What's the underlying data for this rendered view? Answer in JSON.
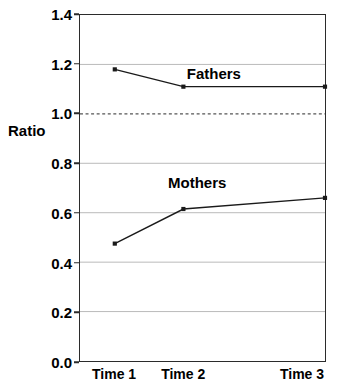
{
  "chart_data": {
    "type": "line",
    "title": "",
    "xlabel": "",
    "ylabel": "Ratio",
    "categories": [
      "Time 1",
      "Time 2",
      "Time 3"
    ],
    "ylim": [
      0.0,
      1.4
    ],
    "yticks": [
      "0.0",
      "0.2",
      "0.4",
      "0.6",
      "0.8",
      "1.0",
      "1.2",
      "1.4"
    ],
    "ytick_values": [
      0.0,
      0.2,
      0.4,
      0.6,
      0.8,
      1.0,
      1.2,
      1.4
    ],
    "grid": true,
    "legend_position": "inline-annotation",
    "reference_line": {
      "value": 1.0,
      "style": "dashed",
      "color": "#555555"
    },
    "series": [
      {
        "name": "Fathers",
        "values": [
          1.18,
          1.11,
          1.11
        ],
        "color": "#1a1a1a",
        "label_x_category_fraction": 1.05,
        "label_y": 1.155
      },
      {
        "name": "Mothers",
        "values": [
          0.475,
          0.615,
          0.66
        ],
        "color": "#1a1a1a",
        "label_x_category_fraction": 0.92,
        "label_y": 0.715
      }
    ],
    "colors": {
      "axis": "#2b2b2b",
      "grid": "#b9b9b9",
      "series": "#1a1a1a",
      "background": "#ffffff"
    }
  }
}
